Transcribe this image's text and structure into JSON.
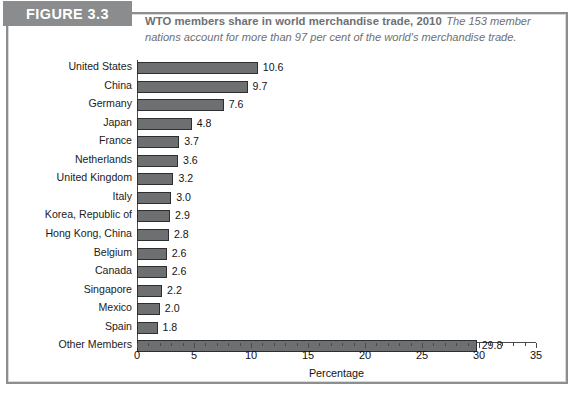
{
  "figure": {
    "tag": "FIGURE 3.3",
    "title": "WTO members share in world merchandise trade, 2010",
    "subtitle": "The 153 member nations account for more than 97 per cent of the world's merchandise trade."
  },
  "colors": {
    "tag_band": "#8a8c8e",
    "header_text": "#6e7072",
    "bar_fill": "#6d6f71",
    "bar_stroke": "#2d2e2f",
    "axis": "#4a4a4a",
    "frame": "#8c8e90"
  },
  "chart_data": {
    "type": "bar",
    "orientation": "horizontal",
    "title": "WTO members share in world merchandise trade, 2010",
    "xlabel": "Percentage",
    "ylabel": "",
    "xlim": [
      0,
      35
    ],
    "xticks": [
      0,
      5,
      10,
      15,
      20,
      25,
      30,
      35
    ],
    "xtick_labels": [
      "0",
      "5",
      "10",
      "15",
      "20",
      "25",
      "30",
      "35"
    ],
    "grid": false,
    "legend": null,
    "categories": [
      "United States",
      "China",
      "Germany",
      "Japan",
      "France",
      "Netherlands",
      "United Kingdom",
      "Italy",
      "Korea, Republic of",
      "Hong Kong, China",
      "Belgium",
      "Canada",
      "Singapore",
      "Mexico",
      "Spain",
      "Other Members"
    ],
    "values": [
      10.6,
      9.7,
      7.6,
      4.8,
      3.7,
      3.6,
      3.2,
      3.0,
      2.9,
      2.8,
      2.6,
      2.6,
      2.2,
      2.0,
      1.8,
      29.8
    ],
    "value_labels": [
      "10.6",
      "9.7",
      "7.6",
      "4.8",
      "3.7",
      "3.6",
      "3.2",
      "3.0",
      "2.9",
      "2.8",
      "2.6",
      "2.6",
      "2.2",
      "2.0",
      "1.8",
      "29.8"
    ]
  }
}
